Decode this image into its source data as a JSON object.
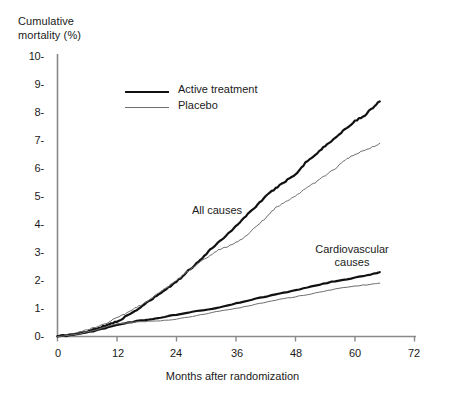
{
  "chart_data": {
    "type": "line",
    "title": "",
    "ylabel": "Cumulative mortality (%)",
    "xlabel": "Months after  randomization",
    "xlim": [
      0,
      72
    ],
    "ylim": [
      0,
      10
    ],
    "xticks": [
      0,
      12,
      24,
      36,
      48,
      60,
      72
    ],
    "yticks": [
      0,
      1,
      2,
      3,
      4,
      5,
      6,
      7,
      8,
      9,
      10
    ],
    "xtick_labels": [
      "0",
      "12",
      "24",
      "36",
      "48",
      "60",
      "72"
    ],
    "ytick_labels": [
      "0-",
      "1-",
      "2-",
      "3-",
      "4-",
      "5-",
      "6-",
      "7-",
      "8-",
      "9-",
      "10-"
    ],
    "grid": false,
    "legend_position": "upper-center",
    "legend": [
      "Active treatment",
      "Placebo"
    ],
    "annotations": [
      {
        "text": "All causes",
        "x": 30,
        "y": 4.7
      },
      {
        "text": "Cardiovascular\ncauses",
        "x": 52,
        "y": 3.3
      }
    ],
    "series": [
      {
        "name": "All causes - Active treatment",
        "group": "All causes",
        "arm": "Active treatment",
        "style": "thick-black",
        "color": "#111111",
        "x": [
          0,
          2,
          4,
          6,
          8,
          10,
          12,
          14,
          16,
          18,
          20,
          22,
          24,
          26,
          28,
          30,
          32,
          34,
          36,
          38,
          40,
          42,
          44,
          46,
          48,
          50,
          52,
          54,
          56,
          58,
          60,
          62,
          64,
          65
        ],
        "y": [
          0.0,
          0.05,
          0.1,
          0.18,
          0.3,
          0.4,
          0.55,
          0.72,
          0.95,
          1.2,
          1.45,
          1.7,
          1.95,
          2.3,
          2.6,
          2.95,
          3.3,
          3.6,
          3.95,
          4.3,
          4.65,
          5.0,
          5.3,
          5.55,
          5.8,
          6.2,
          6.5,
          6.8,
          7.1,
          7.4,
          7.7,
          7.9,
          8.25,
          8.4
        ]
      },
      {
        "name": "All causes - Placebo",
        "group": "All causes",
        "arm": "Placebo",
        "style": "thin-grey",
        "color": "#6e6e6e",
        "x": [
          0,
          2,
          4,
          6,
          8,
          10,
          12,
          14,
          16,
          18,
          20,
          22,
          24,
          26,
          28,
          30,
          32,
          34,
          36,
          38,
          40,
          42,
          44,
          46,
          48,
          50,
          52,
          54,
          56,
          58,
          60,
          62,
          64,
          65
        ],
        "y": [
          0.0,
          0.08,
          0.15,
          0.25,
          0.35,
          0.48,
          0.68,
          0.85,
          1.05,
          1.25,
          1.5,
          1.75,
          2.0,
          2.3,
          2.55,
          2.8,
          3.05,
          3.2,
          3.35,
          3.6,
          3.9,
          4.25,
          4.6,
          4.8,
          5.0,
          5.3,
          5.5,
          5.75,
          6.0,
          6.3,
          6.5,
          6.65,
          6.8,
          6.9
        ]
      },
      {
        "name": "Cardiovascular causes - Active treatment",
        "group": "Cardiovascular causes",
        "arm": "Active treatment",
        "style": "thick-black",
        "color": "#111111",
        "x": [
          0,
          4,
          8,
          12,
          16,
          20,
          24,
          28,
          32,
          36,
          40,
          44,
          48,
          52,
          56,
          60,
          64,
          65
        ],
        "y": [
          0.0,
          0.08,
          0.22,
          0.42,
          0.55,
          0.65,
          0.78,
          0.9,
          1.02,
          1.18,
          1.35,
          1.5,
          1.65,
          1.82,
          1.98,
          2.1,
          2.25,
          2.3
        ]
      },
      {
        "name": "Cardiovascular causes - Placebo",
        "group": "Cardiovascular causes",
        "arm": "Placebo",
        "style": "thin-grey",
        "color": "#6e6e6e",
        "x": [
          0,
          4,
          8,
          12,
          16,
          20,
          24,
          28,
          32,
          36,
          40,
          44,
          48,
          52,
          56,
          60,
          64,
          65
        ],
        "y": [
          0.0,
          0.08,
          0.25,
          0.45,
          0.52,
          0.55,
          0.62,
          0.75,
          0.88,
          1.0,
          1.15,
          1.3,
          1.42,
          1.55,
          1.7,
          1.8,
          1.88,
          1.9
        ]
      }
    ]
  },
  "axis": {
    "y_title": "Cumulative\nmortality (%)",
    "x_title": "Months after  randomization",
    "y_labels": [
      "10-",
      "9-",
      "8-",
      "7-",
      "6-",
      "5-",
      "4-",
      "3-",
      "2-",
      "1-",
      "0-"
    ],
    "x_labels": [
      "0",
      "12",
      "24",
      "36",
      "48",
      "60",
      "72"
    ]
  },
  "legend": {
    "items": [
      {
        "label": "Active treatment",
        "style": "thick"
      },
      {
        "label": "Placebo",
        "style": "thin"
      }
    ]
  },
  "annotations": {
    "all_causes": "All causes",
    "cardiovascular": "Cardiovascular\ncauses"
  },
  "colors": {
    "active": "#111111",
    "placebo": "#6e6e6e",
    "axis": "#8a8a8a",
    "text": "#1a1a1a"
  }
}
